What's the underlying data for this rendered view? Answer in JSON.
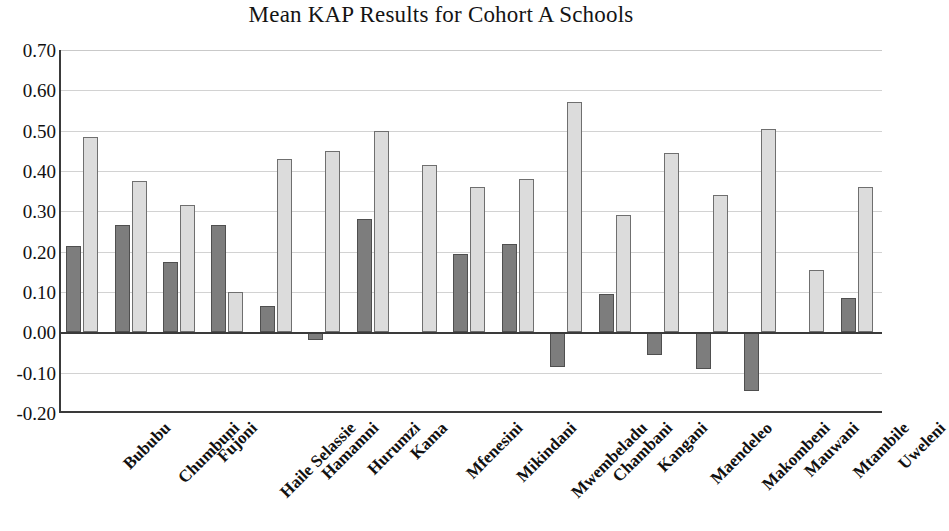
{
  "chart_data": {
    "type": "bar",
    "title": "Mean KAP Results for Cohort A Schools",
    "xlabel": "",
    "ylabel": "",
    "ylim": [
      -0.2,
      0.7
    ],
    "ytick_step": 0.1,
    "ytick_labels": [
      "0.70",
      "0.60",
      "0.50",
      "0.40",
      "0.30",
      "0.20",
      "0.10",
      "0.00",
      "-0.10",
      "-0.20"
    ],
    "ytick_values": [
      0.7,
      0.6,
      0.5,
      0.4,
      0.3,
      0.2,
      0.1,
      0.0,
      -0.1,
      -0.2
    ],
    "grid": true,
    "legend": "none",
    "categories": [
      "Bububu",
      "Chumbuni",
      "Fujoni",
      "Haile Selassie",
      "Hamamni",
      "Hurumzi",
      "Kama",
      "Mfenesini",
      "Mikindani",
      "Mwembeladu",
      "Chambani",
      "Kangani",
      "Maendeleo",
      "Makombeni",
      "Mauwani",
      "Mtambile",
      "Uweleni"
    ],
    "series": [
      {
        "name": "Series 1",
        "color": "#7d7d7d",
        "values": [
          0.215,
          0.265,
          0.175,
          0.265,
          0.065,
          -0.02,
          0.28,
          null,
          0.195,
          0.22,
          -0.085,
          0.095,
          -0.055,
          -0.09,
          -0.145,
          null,
          0.085
        ]
      },
      {
        "name": "Series 2",
        "color": "#dcdcdc",
        "values": [
          0.485,
          0.375,
          0.315,
          0.1,
          0.43,
          0.45,
          0.5,
          0.415,
          0.36,
          0.38,
          0.57,
          0.29,
          0.445,
          0.34,
          0.505,
          0.155,
          0.36
        ]
      }
    ]
  }
}
